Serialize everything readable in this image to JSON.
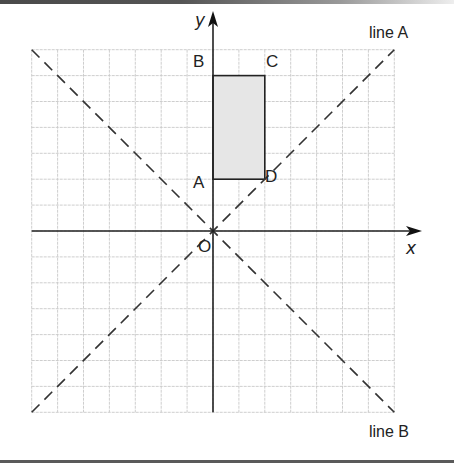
{
  "diagram": {
    "type": "coordinate-grid",
    "grid": {
      "x_range": [
        -7,
        7
      ],
      "y_range": [
        -7,
        7
      ],
      "unit_px": 25.9,
      "origin_px": [
        213,
        231
      ]
    },
    "axes": {
      "x_label": "x",
      "y_label": "y",
      "origin_label": "O"
    },
    "rectangle": {
      "points": [
        {
          "label": "A",
          "x": 0,
          "y": 2
        },
        {
          "label": "B",
          "x": 0,
          "y": 6
        },
        {
          "label": "C",
          "x": 2,
          "y": 6
        },
        {
          "label": "D",
          "x": 2,
          "y": 2
        }
      ],
      "fill": "#e6e6e6"
    },
    "lines": [
      {
        "label": "line A",
        "equation": "y = x",
        "style": "dashed"
      },
      {
        "label": "line B",
        "equation": "y = -x",
        "style": "dashed"
      }
    ]
  },
  "colors": {
    "grid": "#c8c8c8",
    "axis": "#222222",
    "dash": "#333333",
    "shade": "#e6e6e6"
  }
}
